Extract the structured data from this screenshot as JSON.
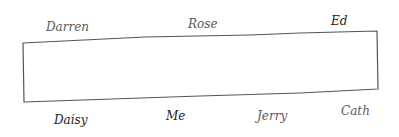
{
  "diagram": {
    "type": "seating-arrangement",
    "table": {
      "stroke_color": "#555555",
      "corners": {
        "top_left": [
          23,
          43
        ],
        "top_mid": [
          145,
          37
        ],
        "top_right": [
          377,
          31
        ],
        "bottom_right": [
          378,
          89
        ],
        "bottom_left": [
          24,
          102
        ]
      }
    },
    "top_side": [
      {
        "name": "Darren",
        "x": 46,
        "y": 21
      },
      {
        "name": "Rose",
        "x": 188,
        "y": 18
      },
      {
        "name": "Ed",
        "x": 331,
        "y": 15
      }
    ],
    "bottom_side": [
      {
        "name": "Daisy",
        "x": 54,
        "y": 114
      },
      {
        "name": "Me",
        "x": 166,
        "y": 110
      },
      {
        "name": "Jerry",
        "x": 257,
        "y": 110
      },
      {
        "name": "Cath",
        "x": 341,
        "y": 105
      }
    ]
  }
}
